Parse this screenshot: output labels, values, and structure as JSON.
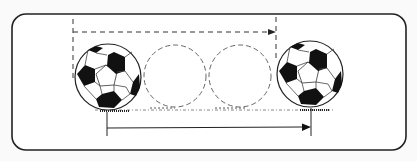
{
  "diagram": {
    "colors": {
      "stroke": "#222222",
      "background": "#fafafa",
      "dash": "#555555"
    },
    "frame": {
      "x": 12,
      "y": 14,
      "width": 394,
      "height": 136,
      "radius": 14
    },
    "balls": [
      {
        "id": "start-ball",
        "cx": 108,
        "cy": 78,
        "r": 33
      },
      {
        "id": "end-ball",
        "cx": 310,
        "cy": 75,
        "r": 33
      }
    ],
    "ghost_balls": [
      {
        "cx": 175,
        "cy": 76,
        "r": 31
      },
      {
        "cx": 240,
        "cy": 76,
        "r": 31
      }
    ],
    "top_dimension": {
      "y": 32,
      "x1": 73,
      "x2": 276,
      "style": "dashed"
    },
    "bottom_dimension": {
      "y": 128,
      "x1": 107,
      "x2": 311,
      "style": "solid"
    },
    "ground_y": 110
  }
}
